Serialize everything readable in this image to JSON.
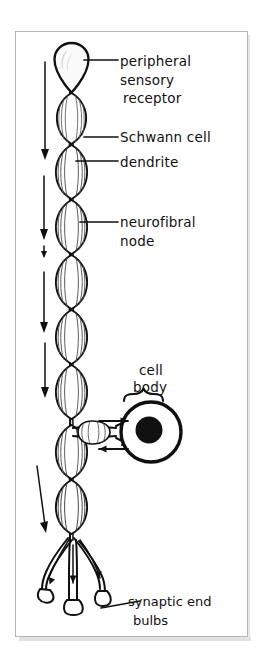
{
  "figure": {
    "background_color": "#ffffff",
    "ink_color": "#101010",
    "frame": {
      "name": "diagram-frame",
      "border_color": "#b8b8b8",
      "x": 15,
      "y": 31,
      "width": 233,
      "height": 606
    }
  },
  "labels": {
    "peripheral_sensory_receptor": {
      "line1": "peripheral",
      "line2": "sensory",
      "line3": "receptor"
    },
    "schwann_cell": "Schwann cell",
    "dendrite": "dendrite",
    "neurofibral_node": {
      "line1": "neurofibral",
      "line2": "node"
    },
    "cell_body": {
      "line1": "cell",
      "line2": "body"
    },
    "synaptic_end_bulbs": {
      "line1": "synaptic end",
      "line2": "bulbs"
    }
  },
  "structures": {
    "receptor_bulb": "peripheral-sensory-receptor-bulb",
    "myelin_segments_count": 11,
    "nucleus": "cell-body-nucleus",
    "terminal_branches_count": 3,
    "direction_arrows": [
      "impulse-arrow-1",
      "impulse-arrow-2",
      "impulse-arrow-3",
      "impulse-arrow-4",
      "impulse-arrow-5",
      "impulse-arrow-6"
    ],
    "cell_body_arrows": [
      "arrow-into-cell-body",
      "arrow-out-of-cell-body"
    ]
  }
}
